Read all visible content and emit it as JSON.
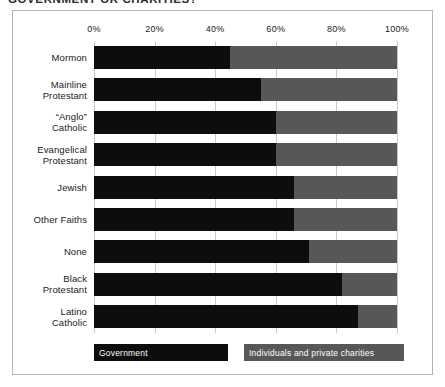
{
  "title": "GOVERNMENT OR CHARITIES?",
  "legend": {
    "government": "Government",
    "private": "Individuals and private charities"
  },
  "axis": {
    "ticks": [
      "0%",
      "20%",
      "40%",
      "60%",
      "80%",
      "100%"
    ]
  },
  "chart_data": {
    "type": "bar",
    "orientation": "horizontal",
    "stacked": true,
    "normalized": true,
    "title": "GOVERNMENT OR CHARITIES?",
    "xlabel": "",
    "ylabel": "",
    "xlim": [
      0,
      100
    ],
    "xticks": [
      0,
      20,
      40,
      60,
      80,
      100
    ],
    "xticklabels": [
      "0%",
      "20%",
      "40%",
      "60%",
      "80%",
      "100%"
    ],
    "grid": true,
    "legend_position": "bottom",
    "categories": [
      "Mormon",
      "Mainline Protestant",
      "“Anglo” Catholic",
      "Evangelical Protestant",
      "Jewish",
      "Other Faiths",
      "None",
      "Black Protestant",
      "Latino Catholic"
    ],
    "category_lines": [
      [
        "Mormon"
      ],
      [
        "Mainline",
        "Protestant"
      ],
      [
        "“Anglo”",
        "Catholic"
      ],
      [
        "Evangelical",
        "Protestant"
      ],
      [
        "Jewish"
      ],
      [
        "Other Faiths"
      ],
      [
        "None"
      ],
      [
        "Black",
        "Protestant"
      ],
      [
        "Latino",
        "Catholic"
      ]
    ],
    "series": [
      {
        "name": "Government",
        "color": "#0d0d0d",
        "values": [
          45,
          55,
          60,
          60,
          66,
          66,
          71,
          82,
          87
        ]
      },
      {
        "name": "Individuals and private charities",
        "color": "#575757",
        "values": [
          55,
          45,
          40,
          40,
          34,
          34,
          29,
          18,
          13
        ]
      }
    ]
  }
}
